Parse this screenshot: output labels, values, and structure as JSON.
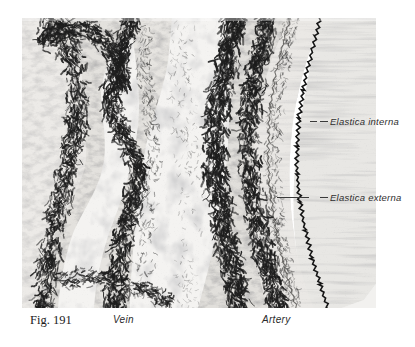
{
  "figure": {
    "number": "Fig. 191",
    "plate": {
      "description": "elastic-stain micrograph of a vein and an artery side by side",
      "background_color": "#f2f1ef",
      "fiber_color": "#1d1d1d",
      "lumen_color": "#ffffff"
    },
    "annotations": [
      {
        "id": "elastica-interna",
        "label": "Elastica interna"
      },
      {
        "id": "elastica-externa",
        "label": "Elastica externa"
      }
    ],
    "organ_labels": [
      {
        "id": "vein",
        "label": "Vein"
      },
      {
        "id": "artery",
        "label": "Artery"
      }
    ]
  }
}
